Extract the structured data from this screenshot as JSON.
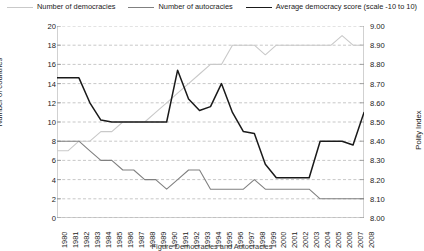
{
  "legend": {
    "position": "top",
    "items": [
      {
        "label": "Number of democracies",
        "color": "#c9c9c9",
        "icon": "line-swatch-icon"
      },
      {
        "label": "Number of autocracies",
        "color": "#808080",
        "icon": "line-swatch-icon"
      },
      {
        "label": "Average democracy score (scale -10 to 10)",
        "color": "#1a1a1a",
        "icon": "line-swatch-icon"
      }
    ]
  },
  "caption": "Figure      Democracies and Autocracies",
  "chart_data": {
    "type": "line",
    "title": "",
    "xlabel": "",
    "ylabel": "Number of countries",
    "y2label": "Polity Index",
    "grid": true,
    "legend_position": "top",
    "ylim": [
      0,
      20
    ],
    "y2lim": [
      8.0,
      9.0
    ],
    "yticks": [
      "0",
      "2",
      "4",
      "6",
      "8",
      "10",
      "12",
      "14",
      "16",
      "18",
      "20"
    ],
    "y2ticks": [
      "8.00",
      "8.10",
      "8.20",
      "8.30",
      "8.40",
      "8.50",
      "8.60",
      "8.70",
      "8.80",
      "8.90",
      "9.00"
    ],
    "x": [
      1980,
      1981,
      1982,
      1983,
      1984,
      1985,
      1986,
      1987,
      1988,
      1989,
      1990,
      1991,
      1992,
      1993,
      1994,
      1995,
      1996,
      1997,
      1998,
      1999,
      2000,
      2001,
      2002,
      2003,
      2004,
      2005,
      2006,
      2007,
      2008
    ],
    "categories": [
      "1980",
      "1981",
      "1982",
      "1983",
      "1984",
      "1985",
      "1986",
      "1987",
      "1988",
      "1989",
      "1990",
      "1991",
      "1992",
      "1993",
      "1994",
      "1995",
      "1996",
      "1997",
      "1998",
      "1999",
      "2000",
      "2001",
      "2002",
      "2003",
      "2004",
      "2005",
      "2006",
      "2007",
      "2008"
    ],
    "series": [
      {
        "name": "Number of democracies",
        "axis": "left",
        "color": "#c9c9c9",
        "values": [
          7,
          7,
          8,
          8,
          9,
          9,
          10,
          10,
          10,
          11,
          12,
          13,
          14,
          15,
          16,
          16,
          18,
          18,
          18,
          17,
          18,
          18,
          18,
          18,
          18,
          18,
          19,
          18,
          18
        ]
      },
      {
        "name": "Number of autocracies",
        "axis": "left",
        "color": "#808080",
        "values": [
          8,
          8,
          8,
          7,
          6,
          6,
          5,
          5,
          4,
          4,
          3,
          4,
          5,
          5,
          3,
          3,
          3,
          3,
          4,
          3,
          3,
          3,
          3,
          3,
          2,
          2,
          2,
          2,
          2
        ]
      },
      {
        "name": "Average democracy score (scale -10 to 10)",
        "axis": "right",
        "color": "#1a1a1a",
        "values": [
          8.73,
          8.73,
          8.73,
          8.6,
          8.51,
          8.5,
          8.5,
          8.5,
          8.5,
          8.5,
          8.5,
          8.77,
          8.62,
          8.56,
          8.58,
          8.7,
          8.55,
          8.45,
          8.44,
          8.28,
          8.21,
          8.21,
          8.21,
          8.21,
          8.4,
          8.4,
          8.4,
          8.38,
          8.55
        ]
      }
    ]
  }
}
